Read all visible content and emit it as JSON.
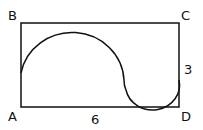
{
  "figure": {
    "labels": {
      "A": "A",
      "B": "B",
      "C": "C",
      "D": "D"
    },
    "measurements": {
      "bottom_side": "6",
      "right_side": "3"
    },
    "colors": {
      "stroke": "#111111",
      "background": "#ffffff"
    }
  }
}
